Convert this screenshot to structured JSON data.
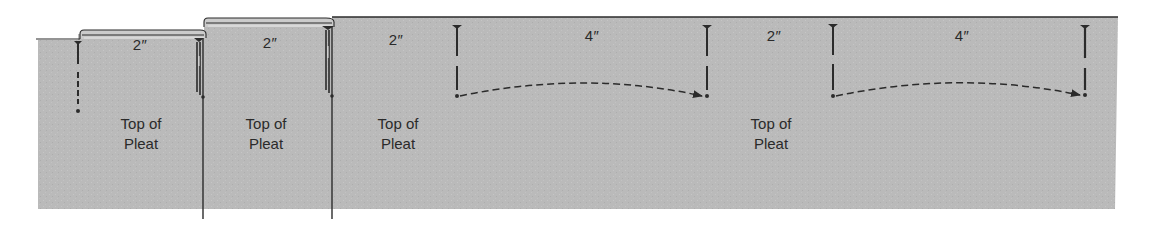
{
  "diagram": {
    "colors": {
      "fabric": "#b9b9b9",
      "fold_top": "#c9c9c9",
      "line": "#2b2b2b",
      "text": "#2a2a2a",
      "background": "#ffffff"
    },
    "measurements": [
      {
        "id": "m1",
        "text": "2″",
        "x": 140,
        "y": 30
      },
      {
        "id": "m2",
        "text": "2″",
        "x": 270,
        "y": 28
      },
      {
        "id": "m3",
        "text": "2″",
        "x": 396,
        "y": 26
      },
      {
        "id": "m4",
        "text": "4″",
        "x": 590,
        "y": 26
      },
      {
        "id": "m5",
        "text": "2″",
        "x": 772,
        "y": 26
      },
      {
        "id": "m6",
        "text": "4″",
        "x": 960,
        "y": 26
      }
    ],
    "pleat_labels": [
      {
        "id": "p1",
        "line1": "Top of",
        "line2": "Pleat",
        "x": 141,
        "y": 112
      },
      {
        "id": "p2",
        "line1": "Top of",
        "line2": "Pleat",
        "x": 266,
        "y": 112
      },
      {
        "id": "p3",
        "line1": "Top of",
        "line2": "Pleat",
        "x": 397,
        "y": 112
      },
      {
        "id": "p4",
        "line1": "Top of",
        "line2": "Pleat",
        "x": 770,
        "y": 112
      }
    ],
    "arrows": [
      {
        "id": "a1",
        "from": "pin at 457",
        "to": "pin at 707",
        "style": "dashed-curve"
      },
      {
        "id": "a2",
        "from": "pin at 833",
        "to": "pin at 1085",
        "style": "dashed-curve"
      }
    ]
  }
}
